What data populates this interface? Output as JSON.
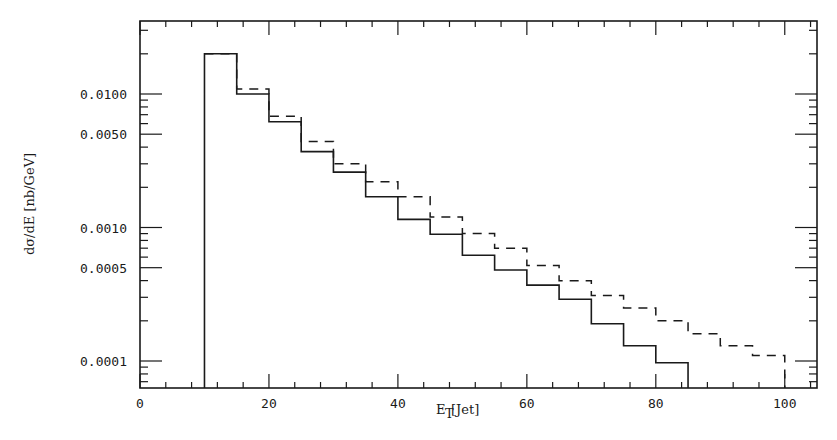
{
  "chart_data": {
    "type": "line",
    "subtype": "step-histogram",
    "title": "",
    "xlabel": "E_T [Jet]",
    "xlabel_main": "E",
    "xlabel_sub": "T",
    "xlabel_rest": " [Jet]",
    "ylabel": "dσ/dE [nb/GeV]",
    "xlim": [
      0,
      105
    ],
    "ylim": [
      6e-05,
      0.035
    ],
    "yscale": "log",
    "grid": false,
    "legend": null,
    "x_ticks": [
      0,
      20,
      40,
      60,
      80,
      100
    ],
    "x_tick_labels": [
      "0",
      "20",
      "40",
      "60",
      "80",
      "100"
    ],
    "y_ticks": [
      0.01,
      0.005,
      0.001,
      0.0005,
      0.0001
    ],
    "y_tick_labels": [
      "0.0100",
      "0.0050",
      "0.0010",
      "0.0005",
      "0.0001"
    ],
    "bin_width": 5,
    "series": [
      {
        "name": "solid",
        "style": "solid",
        "bin_edges": [
          10,
          15,
          20,
          25,
          30,
          35,
          40,
          45,
          50,
          55,
          60,
          65,
          70,
          75,
          80,
          85
        ],
        "values": [
          0.02,
          0.01,
          0.0062,
          0.0037,
          0.0026,
          0.0017,
          0.00115,
          0.00089,
          0.00062,
          0.00048,
          0.00037,
          0.00029,
          0.00019,
          0.00013,
          9.7e-05
        ]
      },
      {
        "name": "dashed",
        "style": "dashed",
        "bin_edges": [
          10,
          15,
          20,
          25,
          30,
          35,
          40,
          45,
          50,
          55,
          60,
          65,
          70,
          75,
          80,
          85,
          90,
          95,
          100
        ],
        "values": [
          0.02,
          0.0109,
          0.0068,
          0.0044,
          0.003,
          0.0022,
          0.0017,
          0.0012,
          0.0009,
          0.0007,
          0.00052,
          0.0004,
          0.00031,
          0.00025,
          0.0002,
          0.00016,
          0.00013,
          0.00011
        ]
      }
    ]
  }
}
